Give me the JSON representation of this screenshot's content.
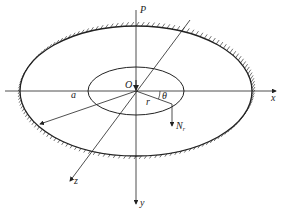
{
  "diagram": {
    "labels": {
      "P": "P",
      "O": "O",
      "a": "a",
      "r": "r",
      "theta": "θ",
      "N": "N",
      "N_sub": "r",
      "x": "x",
      "y": "y",
      "z": "z"
    },
    "colors": {
      "line": "#222222",
      "background": "#ffffff"
    }
  }
}
